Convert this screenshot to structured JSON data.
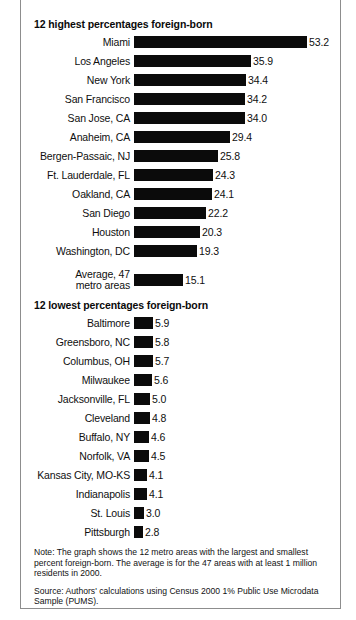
{
  "chart_data": {
    "type": "bar",
    "orientation": "horizontal",
    "title": "",
    "xlabel": "",
    "ylabel": "",
    "xlim": [
      0,
      53.2
    ],
    "grid": false,
    "legend": null,
    "value_format": "one decimal, percent of population foreign-born",
    "sections": [
      {
        "heading": "12 highest percentages foreign-born",
        "categories": [
          "Miami",
          "Los Angeles",
          "New York",
          "San Francisco",
          "San Jose, CA",
          "Anaheim, CA",
          "Bergen-Passaic, NJ",
          "Ft. Lauderdale, FL",
          "Oakland, CA",
          "San Diego",
          "Houston",
          "Washington, DC"
        ],
        "values": [
          53.2,
          35.9,
          34.4,
          34.2,
          34.0,
          29.4,
          25.8,
          24.3,
          24.1,
          22.2,
          20.3,
          19.3
        ]
      },
      {
        "heading": "",
        "categories": [
          "Average, 47\nmetro areas"
        ],
        "values": [
          15.1
        ]
      },
      {
        "heading": "12 lowest percentages foreign-born",
        "categories": [
          "Baltimore",
          "Greensboro, NC",
          "Columbus, OH",
          "Milwaukee",
          "Jacksonville, FL",
          "Cleveland",
          "Buffalo, NY",
          "Norfolk, VA",
          "Kansas City, MO-KS",
          "Indianapolis",
          "St. Louis",
          "Pittsburgh"
        ],
        "values": [
          5.9,
          5.8,
          5.7,
          5.6,
          5.0,
          4.8,
          4.6,
          4.5,
          4.1,
          4.1,
          3.0,
          2.8
        ]
      }
    ],
    "bar_color": "#0b0b0b"
  },
  "headings": {
    "highest": "12 highest percentages foreign-born",
    "lowest": "12 lowest percentages foreign-born"
  },
  "average_row": {
    "label_line1": "Average, 47",
    "label_line2": "metro areas",
    "value": "15.1"
  },
  "notes": {
    "note": "Note: The graph shows the 12 metro areas with the largest and smallest percent foreign-born. The average is for the 47 areas with at least 1 million residents in 2000.",
    "source": "Source: Authors' calculations using Census 2000 1% Public Use Microdata Sample (PUMS)."
  }
}
